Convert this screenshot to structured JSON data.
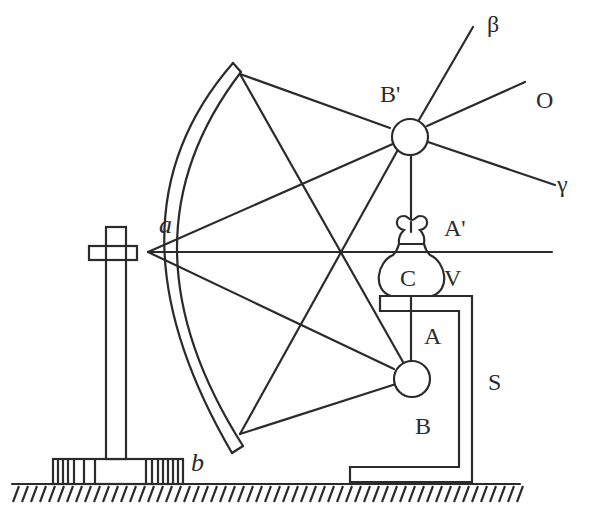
{
  "diagram": {
    "kind": "optical apparatus schematic",
    "labels": {
      "beta": "β",
      "o_ray": "O",
      "gamma": "γ",
      "b_prime": "B'",
      "a_prime": "A'",
      "c": "C",
      "v": "V",
      "a_upper": "A",
      "s": "S",
      "b_upper": "B",
      "a_lower": "a",
      "b_lower": "b"
    },
    "rays_from_b_prime": [
      "β",
      "O",
      "γ"
    ],
    "colors": {
      "ink": "#2b2b2b",
      "background": "#ffffff"
    }
  }
}
